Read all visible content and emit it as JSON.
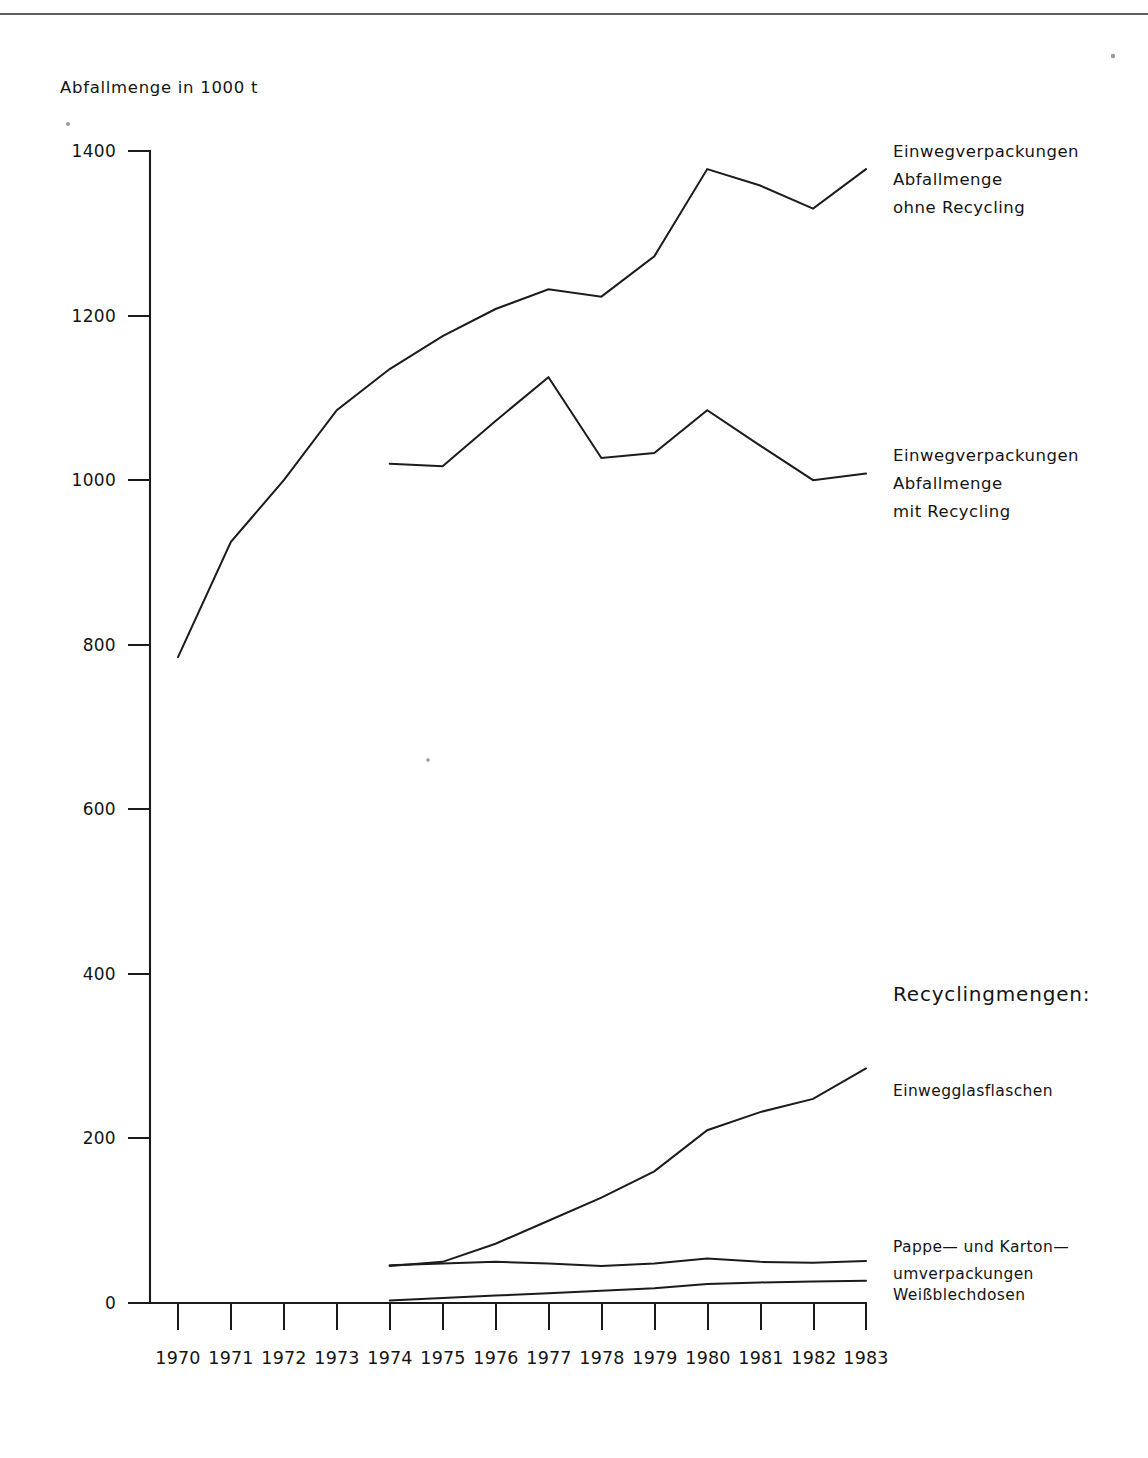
{
  "chart_data": {
    "type": "line",
    "title": "",
    "axis_title": "Abfallmenge in 1000 t",
    "xlabel": "",
    "ylabel": "Abfallmenge in 1000 t",
    "x": [
      1970,
      1971,
      1972,
      1973,
      1974,
      1975,
      1976,
      1977,
      1978,
      1979,
      1980,
      1981,
      1982,
      1983
    ],
    "xtick_labels": [
      "1970",
      "1971",
      "1972",
      "1973",
      "1974",
      "1975",
      "1976",
      "1977",
      "1978",
      "1979",
      "1980",
      "1981",
      "1982",
      "1983"
    ],
    "ytick_labels": [
      "0",
      "200",
      "400",
      "600",
      "800",
      "1000",
      "1200",
      "1400"
    ],
    "yticks": [
      0,
      200,
      400,
      600,
      800,
      1000,
      1200,
      1400
    ],
    "ylim": [
      0,
      1400
    ],
    "xlim": [
      1970,
      1983
    ],
    "grid": false,
    "legend_position": "right",
    "series": [
      {
        "name": "Einwegverpackungen Abfallmenge ohne Recycling",
        "x": [
          1970,
          1971,
          1972,
          1973,
          1974,
          1975,
          1976,
          1977,
          1978,
          1979,
          1980,
          1981,
          1982,
          1983
        ],
        "values": [
          785,
          925,
          1000,
          1085,
          1135,
          1175,
          1208,
          1232,
          1223,
          1272,
          1378,
          1358,
          1330,
          1378
        ]
      },
      {
        "name": "Einwegverpackungen Abfallmenge mit Recycling",
        "x": [
          1974,
          1975,
          1976,
          1977,
          1978,
          1979,
          1980,
          1981,
          1982,
          1983
        ],
        "values": [
          1020,
          1017,
          1072,
          1125,
          1027,
          1033,
          1085,
          1042,
          1000,
          1008
        ]
      },
      {
        "name": "Einwegglasflaschen",
        "x": [
          1974,
          1975,
          1976,
          1977,
          1978,
          1979,
          1980,
          1981,
          1982,
          1983
        ],
        "values": [
          45,
          50,
          72,
          100,
          128,
          160,
          210,
          232,
          248,
          285
        ]
      },
      {
        "name": "Pappe- und Kartonumverpackungen",
        "x": [
          1974,
          1975,
          1976,
          1977,
          1978,
          1979,
          1980,
          1981,
          1982,
          1983
        ],
        "values": [
          46,
          48,
          50,
          48,
          45,
          48,
          54,
          50,
          49,
          51
        ]
      },
      {
        "name": "Weißblechdosen",
        "x": [
          1974,
          1975,
          1976,
          1977,
          1978,
          1979,
          1980,
          1981,
          1982,
          1983
        ],
        "values": [
          3,
          6,
          9,
          12,
          15,
          18,
          23,
          25,
          26,
          27
        ]
      }
    ],
    "annotations": [
      {
        "id": "legend-ohne-recycling",
        "lines": [
          "Einwegverpackungen",
          "Abfallmenge",
          "ohne Recycling"
        ]
      },
      {
        "id": "legend-mit-recycling",
        "lines": [
          "Einwegverpackungen",
          "Abfallmenge",
          "mit Recycling"
        ]
      },
      {
        "id": "legend-recyclingmengen-heading",
        "lines": [
          "Recyclingmengen:"
        ]
      },
      {
        "id": "legend-einwegglasflaschen",
        "lines": [
          "Einwegglasflaschen"
        ]
      },
      {
        "id": "legend-pappe-karton",
        "lines": [
          "Pappe— und Karton—",
          "umverpackungen"
        ]
      },
      {
        "id": "legend-weissblechdosen",
        "lines": [
          "Weißblechdosen"
        ]
      }
    ]
  },
  "labels": {
    "axis_title": "Abfallmenge in 1000 t",
    "y": {
      "t1400": "1400",
      "t1200": "1200",
      "t1000": "1000",
      "t800": "800",
      "t600": "600",
      "t400": "400",
      "t200": "200",
      "t0": "0"
    },
    "x": {
      "y1970": "1970",
      "y1971": "1971",
      "y1972": "1972",
      "y1973": "1973",
      "y1974": "1974",
      "y1975": "1975",
      "y1976": "1976",
      "y1977": "1977",
      "y1978": "1978",
      "y1979": "1979",
      "y1980": "1980",
      "y1981": "1981",
      "y1982": "1982",
      "y1983": "1983"
    },
    "legend": {
      "ohne_l1": "Einwegverpackungen",
      "ohne_l2": "Abfallmenge",
      "ohne_l3": "ohne Recycling",
      "mit_l1": "Einwegverpackungen",
      "mit_l2": "Abfallmenge",
      "mit_l3": "mit Recycling",
      "recycling_heading": "Recyclingmengen:",
      "glas": "Einwegglasflaschen",
      "pappe_l1": "Pappe— und Karton—",
      "pappe_l2": "umverpackungen",
      "weissblech": "Weißblechdosen"
    }
  },
  "colors": {
    "ink": "#1b1b1b",
    "background": "#ffffff"
  }
}
